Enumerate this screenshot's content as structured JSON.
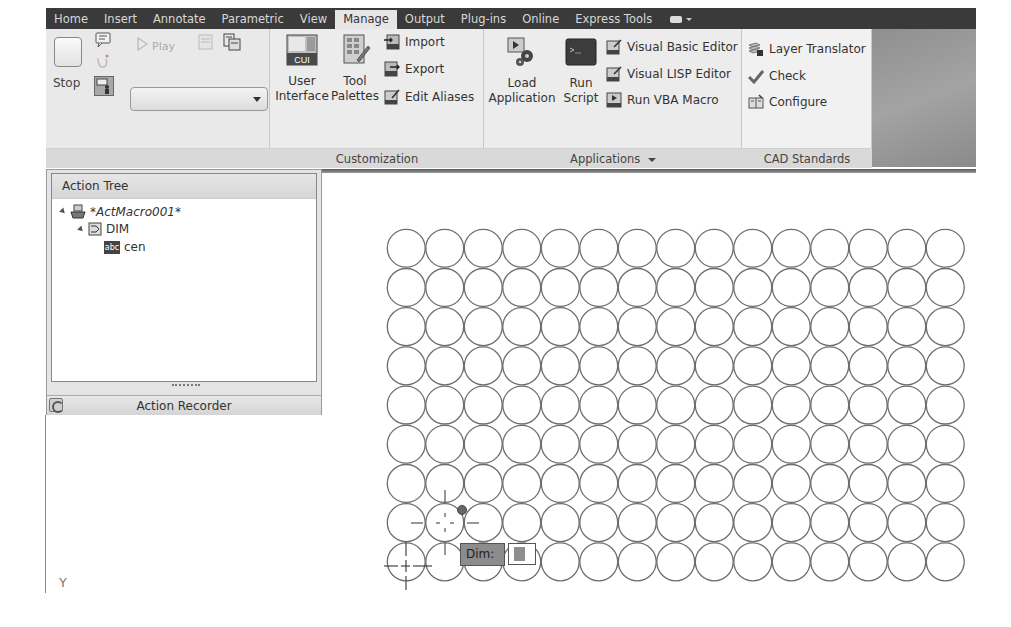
{
  "ribbon": {
    "tabs": [
      {
        "label": "Home"
      },
      {
        "label": "Insert"
      },
      {
        "label": "Annotate"
      },
      {
        "label": "Parametric"
      },
      {
        "label": "View"
      },
      {
        "label": "Manage",
        "active": true
      },
      {
        "label": "Output"
      },
      {
        "label": "Plug-ins"
      },
      {
        "label": "Online"
      },
      {
        "label": "Express Tools"
      }
    ],
    "action_recorder": {
      "stop_label": "Stop",
      "play_label": "Play",
      "macro_dropdown_value": ""
    },
    "customization": {
      "title": "Customization",
      "user_interface_line1": "User",
      "user_interface_line2": "Interface",
      "user_interface_icon_text": "CUI",
      "tool_palettes_line1": "Tool",
      "tool_palettes_line2": "Palettes",
      "import_label": "Import",
      "export_label": "Export",
      "edit_aliases_label": "Edit Aliases"
    },
    "applications": {
      "title": "Applications",
      "load_application_line1": "Load",
      "load_application_line2": "Application",
      "run_script_line1": "Run",
      "run_script_line2": "Script",
      "visual_basic_editor_label": "Visual Basic Editor",
      "visual_lisp_editor_label": "Visual LISP Editor",
      "run_vba_macro_label": "Run VBA Macro"
    },
    "cad_standards": {
      "title": "CAD Standards",
      "layer_translator_label": "Layer Translator",
      "check_label": "Check",
      "configure_label": "Configure"
    }
  },
  "action_tree": {
    "title": "Action Tree",
    "macro_name": "*ActMacro001*",
    "command": "DIM",
    "value_icon_text": "abc",
    "value": "cen",
    "footer_label": "Action Recorder"
  },
  "drawing": {
    "circle_grid": {
      "columns": 15,
      "rows": 9,
      "diameter": 38.5,
      "origin_x": 387,
      "origin_y": 229
    },
    "ucs_label": "Y",
    "dynamic_input": {
      "prompt": "Dim:",
      "value": ""
    }
  },
  "colors": {
    "tab_bar": "#3a3a3a",
    "ribbon_bg": "#e9e9e9",
    "circle_stroke": "#6e6e6e",
    "dim_label_bg": "#8c8c8c"
  }
}
